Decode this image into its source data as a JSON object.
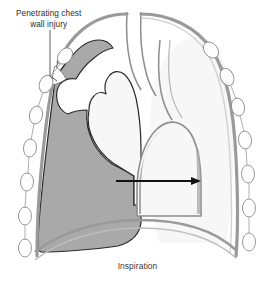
{
  "figure": {
    "caption": "Inspiration",
    "annotations": {
      "injury": {
        "line1": "Penetrating chest",
        "line2": "wall injury",
        "leader_from": [
          50,
          30
        ],
        "leader_to": [
          50,
          78
        ]
      }
    },
    "arrow": {
      "name": "mediastinal-shift-arrow",
      "direction": "right",
      "from": [
        116,
        181
      ],
      "to": [
        201,
        181
      ]
    },
    "colors": {
      "pneumothorax_gray": "#a9a9a9",
      "lung_white": "#f7f7f7",
      "pleural_line": "#9a9a9a",
      "outline_dark": "#2a2a2a",
      "rib_outline": "#8d8d8d",
      "background": "#ffffff",
      "text": "#2b2b2b"
    },
    "structures": [
      {
        "name": "chest-wall-left",
        "kind": "outline"
      },
      {
        "name": "chest-wall-right",
        "kind": "outline"
      },
      {
        "name": "rib-cross-sections-left",
        "count": 6
      },
      {
        "name": "rib-cross-sections-right",
        "count": 7
      },
      {
        "name": "pneumothorax-air-left",
        "kind": "shaded-region"
      },
      {
        "name": "collapsed-left-lung",
        "kind": "lung"
      },
      {
        "name": "right-lung",
        "kind": "lung"
      },
      {
        "name": "mediastinum-heart",
        "kind": "dome"
      },
      {
        "name": "trachea",
        "kind": "tube"
      },
      {
        "name": "diaphragm",
        "kind": "curve"
      },
      {
        "name": "chest-wall-defect",
        "kind": "gap"
      }
    ]
  }
}
